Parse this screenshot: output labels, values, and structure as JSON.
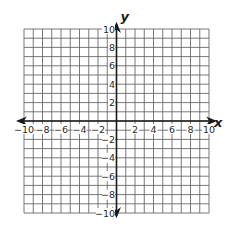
{
  "diagram": {
    "type": "coordinate-plane",
    "x_axis": {
      "name": "x",
      "min": -10,
      "max": 10,
      "step": 1,
      "label_step": 2,
      "tick_labels": [
        "-10",
        "-8",
        "-6",
        "-4",
        "-2",
        "2",
        "4",
        "6",
        "8",
        "10"
      ]
    },
    "y_axis": {
      "name": "y",
      "min": -10,
      "max": 10,
      "step": 1,
      "label_step": 2,
      "tick_labels": [
        "10",
        "8",
        "6",
        "4",
        "2",
        "-2",
        "-4",
        "-6",
        "-8",
        "-10"
      ]
    },
    "grid": {
      "cells_x": 20,
      "cells_y": 20
    },
    "colors": {
      "grid": "#6a6a6a",
      "axis": "#1a1a1a",
      "text": "#2a2a2a",
      "background": "#ffffff"
    }
  }
}
